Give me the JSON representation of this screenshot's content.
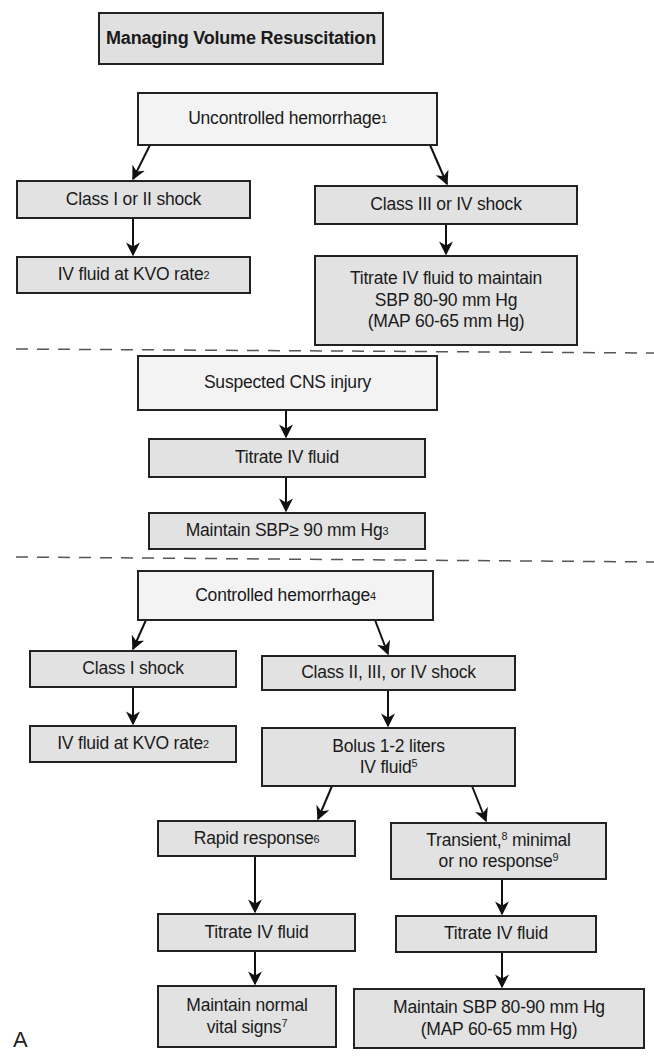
{
  "title": "Managing Volume Resuscitation",
  "figure_label": "A",
  "colors": {
    "border": "#222222",
    "decision_fill": "#f3f3f3",
    "action_fill": "#e2e2e2",
    "dash_line": "#555555"
  },
  "sections": [
    {
      "name": "uncontrolled",
      "nodes": {
        "root": {
          "text": "Uncontrolled hemorrhage",
          "sup": "1"
        },
        "left_class": {
          "text": "Class I or II shock"
        },
        "left_action": {
          "text": "IV fluid at KVO rate",
          "sup": "2"
        },
        "right_class": {
          "text": "Class III or IV shock"
        },
        "right_action": {
          "text": "Titrate IV fluid to maintain\nSBP 80-90 mm Hg\n(MAP 60-65 mm Hg)"
        }
      }
    },
    {
      "name": "cns",
      "nodes": {
        "root": {
          "text": "Suspected CNS injury"
        },
        "step1": {
          "text": "Titrate IV fluid"
        },
        "step2": {
          "text": "Maintain SBP≥ 90 mm Hg",
          "sup": "3"
        }
      }
    },
    {
      "name": "controlled",
      "nodes": {
        "root": {
          "text": "Controlled hemorrhage",
          "sup": "4"
        },
        "left_class": {
          "text": "Class I shock"
        },
        "left_action": {
          "text": "IV fluid at KVO rate",
          "sup": "2"
        },
        "right_class": {
          "text": "Class II, III, or IV shock"
        },
        "bolus_line1": {
          "text": "Bolus 1-2 liters"
        },
        "bolus_line2": {
          "text": "IV fluid",
          "sup": "5"
        },
        "rapid": {
          "text": "Rapid response",
          "sup": "6"
        },
        "transient_line1": {
          "text": "Transient,",
          "sup": "8",
          "rest": " minimal"
        },
        "transient_line2": {
          "text": "or no response",
          "sup": "9"
        },
        "rapid_titrate": {
          "text": "Titrate IV fluid"
        },
        "transient_titrate": {
          "text": "Titrate IV fluid"
        },
        "rapid_goal_line1": {
          "text": "Maintain normal"
        },
        "rapid_goal_line2": {
          "text": "vital signs",
          "sup": "7"
        },
        "transient_goal": {
          "text": "Maintain SBP 80-90 mm Hg\n(MAP 60-65 mm Hg)"
        }
      }
    }
  ]
}
